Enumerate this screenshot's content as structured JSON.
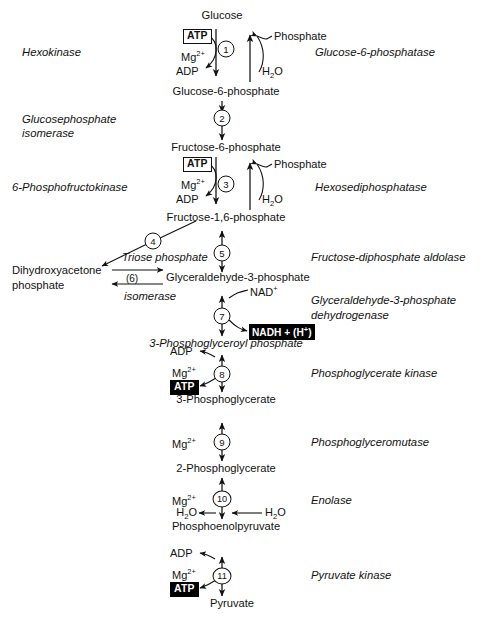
{
  "diagram": {
    "accent_color": "#111111",
    "highlight_box_color": "#000000"
  },
  "metabolites": {
    "glucose": "Glucose",
    "glucose_6_phosphate": "Glucose-6-phosphate",
    "fructose_6_phosphate": "Fructose-6-phosphate",
    "fructose_1_6_phosphate": "Fructose-1,6-phosphate",
    "triose_phosphate": "Triose phosphate",
    "dihydroxyacetone_phosphate_line1": "Dihydroxyacetone",
    "dihydroxyacetone_phosphate_line2": "phosphate",
    "glyceraldehyde_3_phosphate": "Glyceraldehyde-3-phosphate",
    "phosphoglyceroyl_phosphate": "3-Phosphoglyceroyl phosphate",
    "phosphoglycerate_3": "3-Phosphoglycerate",
    "phosphoglycerate_2": "2-Phosphoglycerate",
    "phosphoenolpyruvate": "Phosphoenolpyruvate",
    "pyruvate": "Pyruvate"
  },
  "enzymes_left": [
    {
      "id": "hexokinase",
      "label": "Hexokinase"
    },
    {
      "id": "glucosephosphate-isomerase-line1",
      "label": "Glucosephosphate"
    },
    {
      "id": "glucosephosphate-isomerase-line2",
      "label": "isomerase"
    },
    {
      "id": "phosphofructokinase",
      "label": "6-Phosphofructokinase"
    }
  ],
  "enzymes_right": [
    {
      "id": "glucose-6-phosphatase",
      "label": "Glucose-6-phosphatase"
    },
    {
      "id": "hexosediphosphatase",
      "label": "Hexosediphosphatase"
    },
    {
      "id": "fructose-diphosphate-aldolase",
      "label": "Fructose-diphosphate aldolase"
    },
    {
      "id": "gapdh-line1",
      "label": "Glyceraldehyde-3-phosphate"
    },
    {
      "id": "gapdh-line2",
      "label": "dehydrogenase"
    },
    {
      "id": "phosphoglycerate-kinase",
      "label": "Phosphoglycerate kinase"
    },
    {
      "id": "phosphoglyceromutase",
      "label": "Phosphoglyceromutase"
    },
    {
      "id": "enolase",
      "label": "Enolase"
    },
    {
      "id": "pyruvate-kinase",
      "label": "Pyruvate kinase"
    }
  ],
  "isomerase_label": "isomerase",
  "cofactors": {
    "atp": "ATP",
    "adp": "ADP",
    "mg": "Mg",
    "mg_charge": "2+",
    "phosphate": "Phosphate",
    "water": "H",
    "water_sub": "2",
    "water_tail": "O",
    "nad": "NAD",
    "nad_charge": "+",
    "nadh": "NADH + (H",
    "nadh_charge": "+",
    "nadh_tail": ")"
  },
  "steps": [
    {
      "number": "1",
      "style": "circle"
    },
    {
      "number": "2",
      "style": "circle"
    },
    {
      "number": "3",
      "style": "circle"
    },
    {
      "number": "4",
      "style": "circle"
    },
    {
      "number": "5",
      "style": "circle"
    },
    {
      "number": "(6)",
      "style": "paren"
    },
    {
      "number": "7",
      "style": "circle"
    },
    {
      "number": "8",
      "style": "circle"
    },
    {
      "number": "9",
      "style": "circle"
    },
    {
      "number": "10",
      "style": "circle"
    },
    {
      "number": "11",
      "style": "circle"
    }
  ]
}
